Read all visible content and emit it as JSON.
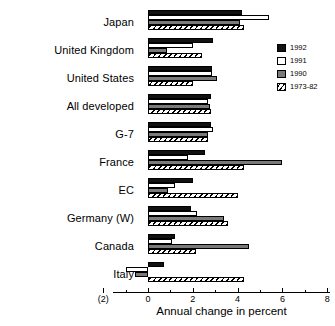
{
  "chart_data": {
    "type": "bar",
    "orientation": "horizontal",
    "title": "",
    "xlabel": "Annual change in percent",
    "ylabel": "",
    "xlim": [
      -2,
      8
    ],
    "xticks": [
      -2,
      0,
      2,
      4,
      6,
      8
    ],
    "xtick_labels": [
      "(2)",
      "0",
      "2",
      "4",
      "6",
      "8"
    ],
    "minor_tick_step": 1,
    "grid": false,
    "legend_position": "top-right",
    "categories": [
      "Japan",
      "United Kingdom",
      "United States",
      "All developed",
      "G-7",
      "France",
      "EC",
      "Germany (W)",
      "Canada",
      "Italy"
    ],
    "series": [
      {
        "name": "1992",
        "style": "black",
        "color": "#111111",
        "values": [
          4.2,
          2.9,
          2.85,
          2.8,
          2.8,
          2.55,
          2.0,
          1.9,
          1.2,
          0.7
        ]
      },
      {
        "name": "1991",
        "style": "white",
        "color": "#ffffff",
        "values": [
          5.4,
          2.0,
          2.85,
          2.7,
          2.9,
          1.8,
          1.2,
          2.2,
          1.05,
          -1.0
        ]
      },
      {
        "name": "1990",
        "style": "gray",
        "color": "#7a7a7a",
        "values": [
          4.1,
          0.85,
          3.1,
          2.75,
          2.7,
          6.0,
          0.9,
          3.4,
          4.5,
          -0.6
        ]
      },
      {
        "name": "1973-82",
        "style": "hatched",
        "color": "#ffffff",
        "values": [
          4.3,
          2.4,
          2.0,
          2.8,
          2.7,
          4.3,
          4.0,
          3.55,
          2.15,
          4.3
        ]
      }
    ]
  },
  "legend": {
    "items": [
      {
        "label": "1992"
      },
      {
        "label": "1991"
      },
      {
        "label": "1990"
      },
      {
        "label": "1973-82"
      }
    ]
  }
}
